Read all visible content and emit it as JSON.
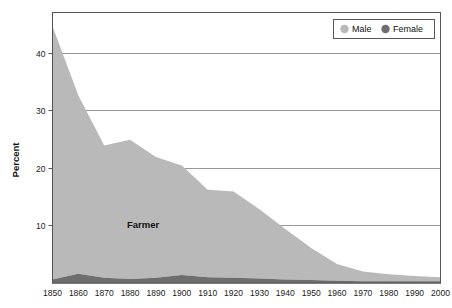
{
  "chart_data": {
    "type": "area",
    "title": "",
    "subtitle": "",
    "xlabel": "",
    "ylabel": "Percent",
    "stacked": true,
    "grid": true,
    "xlim": [
      1850,
      2000
    ],
    "ylim": [
      0,
      47
    ],
    "y_ticks": [
      10,
      20,
      30,
      40
    ],
    "y_tick_labels": [
      "10",
      "20",
      "30",
      "40"
    ],
    "x": [
      1850,
      1860,
      1870,
      1880,
      1890,
      1900,
      1910,
      1920,
      1930,
      1940,
      1950,
      1960,
      1970,
      1980,
      1990,
      2000
    ],
    "x_tick_labels": [
      "1850",
      "1860",
      "1870",
      "1880",
      "1890",
      "1900",
      "1910",
      "1920",
      "1930",
      "1940",
      "1950",
      "1960",
      "1970",
      "1980",
      "1990",
      "2000"
    ],
    "legend_position": "top-right",
    "series": [
      {
        "name": "Male",
        "color": "#b9b9b9",
        "values": [
          44.0,
          31.0,
          23.0,
          24.2,
          21.0,
          19.0,
          15.2,
          15.0,
          12.0,
          8.8,
          5.6,
          2.9,
          1.7,
          1.2,
          0.9,
          0.7
        ]
      },
      {
        "name": "Female",
        "color": "#6e6e6e",
        "values": [
          0.6,
          1.6,
          0.9,
          0.7,
          0.9,
          1.4,
          1.0,
          0.9,
          0.8,
          0.6,
          0.5,
          0.4,
          0.3,
          0.3,
          0.3,
          0.3
        ]
      }
    ],
    "annotations": [
      {
        "text": "Farmer",
        "x": 1885,
        "y": 9.5
      }
    ]
  },
  "legend": {
    "items": [
      {
        "label": "Male",
        "marker": "circle",
        "color": "#b9b9b9"
      },
      {
        "label": "Female",
        "marker": "circle",
        "color": "#6e6e6e"
      }
    ]
  },
  "colors": {
    "male": "#b9b9b9",
    "female": "#6e6e6e",
    "grid": "#8c8c8c",
    "axis": "#555555",
    "text": "#111111",
    "background": "#ffffff"
  }
}
